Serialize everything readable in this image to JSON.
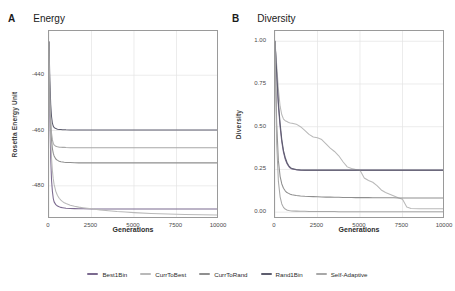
{
  "figure": {
    "background": "#ffffff",
    "panels": [
      "A",
      "B"
    ]
  },
  "panel_a": {
    "letter": "A",
    "title": "Energy"
  },
  "panel_b": {
    "letter": "B",
    "title": "Diversity"
  },
  "legend": {
    "position": "bottom-center",
    "entries": [
      {
        "label": "Best1Bin",
        "color": "#7b6a8f"
      },
      {
        "label": "CurrToBest",
        "color": "#b9b9b9"
      },
      {
        "label": "CurrToRand",
        "color": "#8f8f8f"
      },
      {
        "label": "Rand1Bin",
        "color": "#5d5d6e"
      },
      {
        "label": "Self-Adaptive",
        "color": "#a8a8a8"
      }
    ]
  },
  "chart_data": [
    {
      "type": "line",
      "panel": "A",
      "title": "Energy",
      "xlabel": "Generations",
      "ylabel": "Rosetta Energy Unit",
      "xlim": [
        0,
        10000
      ],
      "ylim": [
        -492,
        -424
      ],
      "xticks": [
        0,
        2500,
        5000,
        7500,
        10000
      ],
      "xticklabels": [
        "0",
        "2500",
        "5000",
        "7500",
        "10000"
      ],
      "yticks": [
        -440,
        -460,
        -480
      ],
      "yticklabels": [
        "-440",
        "-460",
        "-480"
      ],
      "grid": true,
      "x": [
        0,
        50,
        100,
        150,
        200,
        250,
        300,
        400,
        500,
        600,
        700,
        800,
        900,
        1000,
        1250,
        1500,
        1750,
        2000,
        2500,
        3000,
        3500,
        4000,
        4500,
        5000,
        6000,
        7000,
        8000,
        9000,
        10000
      ],
      "series": [
        {
          "name": "Best1Bin",
          "color": "#7b6a8f",
          "values": [
            -428.0,
            -455.0,
            -470.0,
            -478.0,
            -482.0,
            -484.5,
            -485.8,
            -486.8,
            -487.3,
            -487.6,
            -487.8,
            -487.9,
            -488.0,
            -488.1,
            -488.2,
            -488.25,
            -488.3,
            -488.3,
            -488.35,
            -488.4,
            -488.4,
            -488.4,
            -488.4,
            -488.4,
            -488.4,
            -488.4,
            -488.4,
            -488.4,
            -488.4
          ]
        },
        {
          "name": "CurrToBest",
          "color": "#b9b9b9",
          "values": [
            -428.0,
            -450.0,
            -463.0,
            -470.0,
            -474.5,
            -477.5,
            -479.5,
            -482.0,
            -483.5,
            -484.5,
            -485.2,
            -485.7,
            -486.1,
            -486.4,
            -487.0,
            -487.4,
            -487.7,
            -487.9,
            -488.3,
            -488.7,
            -489.0,
            -489.3,
            -489.5,
            -489.7,
            -490.0,
            -490.2,
            -490.4,
            -490.5,
            -490.6
          ]
        },
        {
          "name": "CurrToRand",
          "color": "#8f8f8f",
          "values": [
            -428.0,
            -448.0,
            -458.0,
            -463.5,
            -466.5,
            -468.2,
            -469.2,
            -470.3,
            -470.8,
            -471.1,
            -471.3,
            -471.4,
            -471.5,
            -471.55,
            -471.6,
            -471.65,
            -471.7,
            -471.7,
            -471.7,
            -471.7,
            -471.7,
            -471.7,
            -471.7,
            -471.7,
            -471.7,
            -471.7,
            -471.7,
            -471.7,
            -471.7
          ]
        },
        {
          "name": "Rand1Bin",
          "color": "#5d5d6e",
          "values": [
            -428.0,
            -442.0,
            -450.5,
            -455.0,
            -457.3,
            -458.4,
            -458.9,
            -459.3,
            -459.5,
            -459.6,
            -459.65,
            -459.7,
            -459.7,
            -459.75,
            -459.8,
            -459.8,
            -459.8,
            -459.8,
            -459.8,
            -459.8,
            -459.8,
            -459.8,
            -459.8,
            -459.8,
            -459.8,
            -459.8,
            -459.8,
            -459.8,
            -459.8
          ]
        },
        {
          "name": "Self-Adaptive",
          "color": "#a8a8a8",
          "values": [
            -428.0,
            -447.0,
            -456.5,
            -461.0,
            -463.4,
            -464.6,
            -465.2,
            -465.7,
            -465.9,
            -466.0,
            -466.05,
            -466.1,
            -466.1,
            -466.15,
            -466.2,
            -466.2,
            -466.2,
            -466.2,
            -466.2,
            -466.2,
            -466.2,
            -466.2,
            -466.2,
            -466.2,
            -466.2,
            -466.2,
            -466.2,
            -466.2,
            -466.2
          ]
        }
      ]
    },
    {
      "type": "line",
      "panel": "B",
      "title": "Diversity",
      "xlabel": "Generations",
      "ylabel": "Diversity",
      "xlim": [
        0,
        10000
      ],
      "ylim": [
        -0.04,
        1.06
      ],
      "xticks": [
        0,
        2500,
        5000,
        7500,
        10000
      ],
      "xticklabels": [
        "0",
        "2500",
        "5000",
        "7500",
        "10000"
      ],
      "yticks": [
        0.0,
        0.25,
        0.5,
        0.75,
        1.0
      ],
      "yticklabels": [
        "0.00",
        "0.25",
        "0.50",
        "0.75",
        "1.00"
      ],
      "grid": true,
      "x": [
        0,
        100,
        200,
        300,
        400,
        500,
        600,
        700,
        800,
        900,
        1000,
        1250,
        1500,
        1750,
        2000,
        2250,
        2500,
        2750,
        3000,
        3250,
        3500,
        3750,
        4000,
        4250,
        4500,
        4750,
        5000,
        5250,
        5500,
        5750,
        6000,
        6250,
        6500,
        6750,
        7000,
        7250,
        7500,
        7750,
        8000,
        8500,
        9000,
        9500,
        10000
      ],
      "series": [
        {
          "name": "Best1Bin",
          "color": "#7b6a8f",
          "values": [
            1.0,
            0.8,
            0.62,
            0.5,
            0.41,
            0.35,
            0.31,
            0.285,
            0.268,
            0.258,
            0.252,
            0.248,
            0.246,
            0.245,
            0.245,
            0.245,
            0.245,
            0.245,
            0.245,
            0.245,
            0.245,
            0.245,
            0.245,
            0.245,
            0.245,
            0.245,
            0.245,
            0.245,
            0.245,
            0.245,
            0.245,
            0.245,
            0.245,
            0.245,
            0.245,
            0.245,
            0.245,
            0.245,
            0.245,
            0.245,
            0.245,
            0.245,
            0.245
          ]
        },
        {
          "name": "CurrToBest",
          "color": "#b9b9b9",
          "values": [
            1.0,
            0.86,
            0.72,
            0.62,
            0.57,
            0.545,
            0.535,
            0.53,
            0.525,
            0.522,
            0.52,
            0.515,
            0.5,
            0.478,
            0.455,
            0.44,
            0.435,
            0.425,
            0.4,
            0.375,
            0.355,
            0.33,
            0.295,
            0.265,
            0.255,
            0.25,
            0.245,
            0.2,
            0.185,
            0.175,
            0.155,
            0.13,
            0.115,
            0.105,
            0.095,
            0.085,
            0.075,
            0.03,
            0.022,
            0.02,
            0.02,
            0.02,
            0.02
          ]
        },
        {
          "name": "CurrToRand",
          "color": "#8f8f8f",
          "values": [
            1.0,
            0.52,
            0.3,
            0.21,
            0.165,
            0.14,
            0.125,
            0.115,
            0.11,
            0.105,
            0.102,
            0.098,
            0.095,
            0.093,
            0.092,
            0.091,
            0.09,
            0.089,
            0.088,
            0.088,
            0.087,
            0.087,
            0.086,
            0.086,
            0.086,
            0.085,
            0.085,
            0.085,
            0.085,
            0.084,
            0.084,
            0.084,
            0.084,
            0.084,
            0.084,
            0.083,
            0.083,
            0.083,
            0.083,
            0.083,
            0.083,
            0.083,
            0.083
          ]
        },
        {
          "name": "Rand1Bin",
          "color": "#5d5d6e",
          "values": [
            1.0,
            0.82,
            0.64,
            0.52,
            0.425,
            0.36,
            0.32,
            0.292,
            0.273,
            0.262,
            0.255,
            0.249,
            0.247,
            0.246,
            0.246,
            0.246,
            0.246,
            0.246,
            0.246,
            0.246,
            0.246,
            0.246,
            0.246,
            0.246,
            0.246,
            0.246,
            0.246,
            0.246,
            0.246,
            0.246,
            0.246,
            0.246,
            0.246,
            0.246,
            0.246,
            0.246,
            0.246,
            0.246,
            0.246,
            0.246,
            0.246,
            0.246,
            0.246
          ]
        },
        {
          "name": "Self-Adaptive",
          "color": "#a8a8a8",
          "values": [
            1.0,
            0.4,
            0.18,
            0.09,
            0.048,
            0.028,
            0.018,
            0.013,
            0.01,
            0.008,
            0.007,
            0.006,
            0.005,
            0.005,
            0.004,
            0.004,
            0.004,
            0.004,
            0.004,
            0.004,
            0.004,
            0.003,
            0.003,
            0.003,
            0.003,
            0.003,
            0.003,
            0.003,
            0.003,
            0.003,
            0.003,
            0.003,
            0.003,
            0.003,
            0.003,
            0.003,
            0.003,
            0.003,
            0.003,
            0.003,
            0.003,
            0.003,
            0.003
          ]
        }
      ]
    }
  ]
}
